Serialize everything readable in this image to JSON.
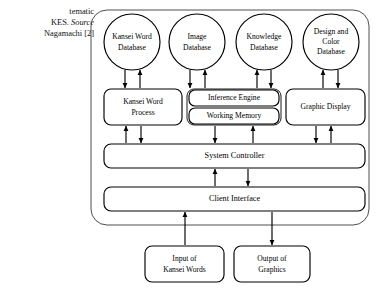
{
  "caption": {
    "lines": [
      "tematic",
      "KES. ",
      " Nagamachi [2]"
    ],
    "line2_italic": "Source",
    "full_visible_text": "tematic KES. Source  Nagamachi [2]"
  },
  "diagram": {
    "type": "block-diagram",
    "title_visible": false,
    "boundary": {
      "shape": "rounded-rectangle",
      "label": "system-boundary"
    },
    "databases": [
      {
        "id": "kansei-word-database",
        "lines": [
          "Kansei Word",
          "Database"
        ],
        "shape": "circle"
      },
      {
        "id": "image-database",
        "lines": [
          "Image",
          "Database"
        ],
        "shape": "circle"
      },
      {
        "id": "knowledge-database",
        "lines": [
          "Knowledge",
          "Database"
        ],
        "shape": "circle"
      },
      {
        "id": "design-and-color-database",
        "lines": [
          "Design and",
          "Color",
          "Database"
        ],
        "shape": "circle"
      }
    ],
    "processes": [
      {
        "id": "kansei-word-process",
        "lines": [
          "Kansei Word",
          "Process"
        ],
        "shape": "rounded-rectangle"
      },
      {
        "id": "inference-engine",
        "lines": [
          "Inference Engine"
        ],
        "shape": "rounded-rectangle"
      },
      {
        "id": "working-memory",
        "lines": [
          "Working Memory"
        ],
        "shape": "rounded-rectangle"
      },
      {
        "id": "graphic-display",
        "lines": [
          "Graphic Display"
        ],
        "shape": "rounded-rectangle"
      }
    ],
    "bars": [
      {
        "id": "system-controller",
        "label": "System Controller",
        "shape": "rounded-rectangle"
      },
      {
        "id": "client-interface",
        "label": "Client Interface",
        "shape": "rounded-rectangle"
      }
    ],
    "io": [
      {
        "id": "input-of-kansei-words",
        "lines": [
          "Input of",
          "Kansei Words"
        ],
        "shape": "rounded-rectangle",
        "direction": "up"
      },
      {
        "id": "output-of-graphics",
        "lines": [
          "Output of",
          "Graphics"
        ],
        "shape": "rounded-rectangle",
        "direction": "down"
      }
    ],
    "colors": {
      "stroke": "#000000",
      "fill": "#ffffff",
      "boundary_stroke": "#3a3a3a",
      "background": "#ffffff"
    }
  }
}
